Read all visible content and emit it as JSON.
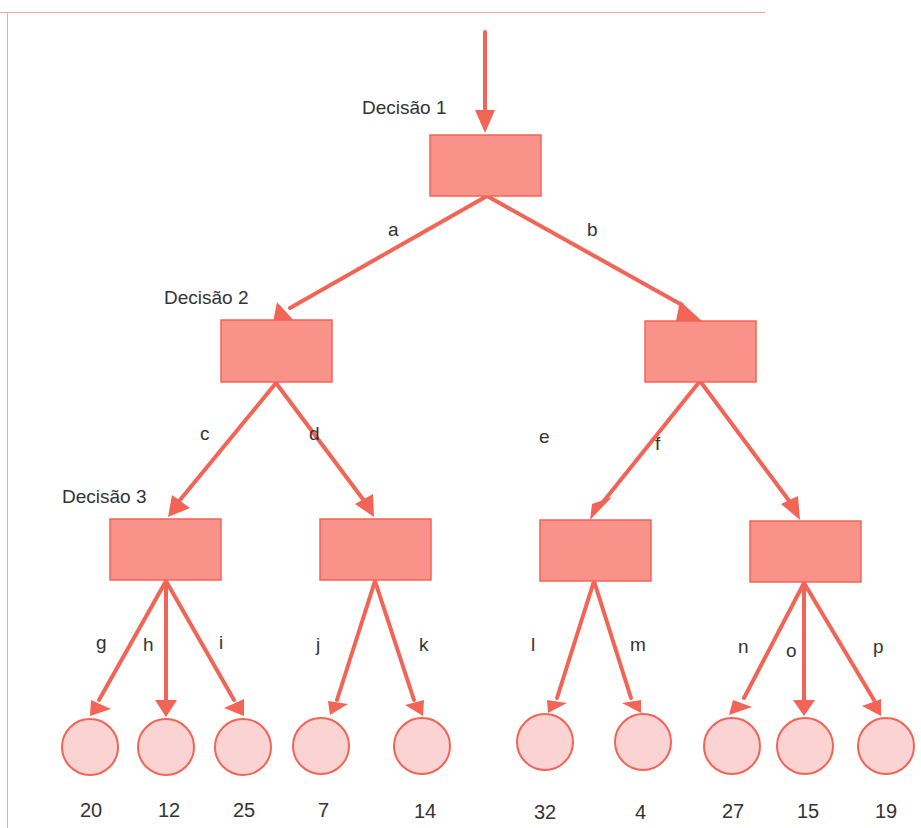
{
  "colors": {
    "line": "#f26456",
    "box_fill": "#f99389",
    "box_stroke": "#f26456",
    "leaf_fill": "#fbd3d2",
    "leaf_stroke": "#f26456",
    "frame": "#f2a9a6",
    "text": "#333333"
  },
  "levels": [
    {
      "label": "Decisão 1"
    },
    {
      "label": "Decisão 2"
    },
    {
      "label": "Decisão 3"
    }
  ],
  "edges": {
    "a": "a",
    "b": "b",
    "c": "c",
    "d": "d",
    "e": "e",
    "f": "f",
    "g": "g",
    "h": "h",
    "i": "i",
    "j": "j",
    "k": "k",
    "l": "l",
    "m": "m",
    "n": "n",
    "o": "o",
    "p": "p"
  },
  "leaves": [
    {
      "edge": "g",
      "value": "20"
    },
    {
      "edge": "h",
      "value": "12"
    },
    {
      "edge": "i",
      "value": "25"
    },
    {
      "edge": "j",
      "value": "7"
    },
    {
      "edge": "k",
      "value": "14"
    },
    {
      "edge": "l",
      "value": "32"
    },
    {
      "edge": "m",
      "value": "4"
    },
    {
      "edge": "n",
      "value": "27"
    },
    {
      "edge": "o",
      "value": "15"
    },
    {
      "edge": "p",
      "value": "19"
    }
  ]
}
